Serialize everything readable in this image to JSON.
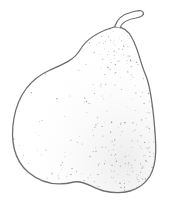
{
  "image": {
    "subject": "pear",
    "style": "stippled line drawing",
    "colors": {
      "background": "#ffffff",
      "outline": "#6e6e6e",
      "stipple": "#8a8a8a"
    }
  }
}
